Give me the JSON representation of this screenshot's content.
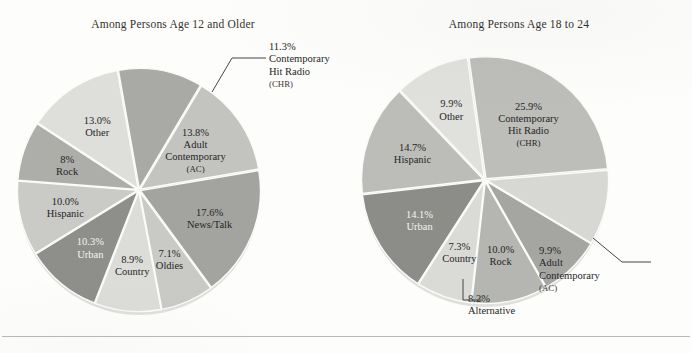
{
  "figure": {
    "background_color": "#fdfdfc",
    "rule_color": "#b9b9b6"
  },
  "chart_data": [
    {
      "type": "pie",
      "id": "age-12-and-older",
      "title": "Among Persons Age 12 and Older",
      "start_angle_deg": 350,
      "direction": "clockwise",
      "center": {
        "x": 139,
        "y": 190
      },
      "radius": 120,
      "categories": [
        "Contemporary Hit Radio (CHR)",
        "Adult Contemporary (AC)",
        "News/Talk",
        "Oldies",
        "Country",
        "Urban",
        "Hispanic",
        "Rock",
        "Other"
      ],
      "values": [
        11.3,
        13.8,
        17.6,
        7.1,
        8.9,
        10.3,
        10.0,
        8.0,
        13.0
      ],
      "slices": [
        {
          "label_pct": "11.3%",
          "name_lines": [
            "Contemporary",
            "Hit Radio"
          ],
          "sub": "(CHR)",
          "value": 11.3,
          "color": "#a9a9a6",
          "label_mode": "callout",
          "text_color": "dark"
        },
        {
          "label_pct": "13.8%",
          "name_lines": [
            "Adult",
            "Contemporary"
          ],
          "sub": "(AC)",
          "value": 13.8,
          "color": "#c3c3bf",
          "label_mode": "inside",
          "text_color": "dark"
        },
        {
          "label_pct": "17.6%",
          "name_lines": [
            "News/Talk"
          ],
          "sub": "",
          "value": 17.6,
          "color": "#a3a3a0",
          "label_mode": "inside",
          "text_color": "dark"
        },
        {
          "label_pct": "7.1%",
          "name_lines": [
            "Oldies"
          ],
          "sub": "",
          "value": 7.1,
          "color": "#c9c9c5",
          "label_mode": "inside",
          "text_color": "dark"
        },
        {
          "label_pct": "8.9%",
          "name_lines": [
            "Country"
          ],
          "sub": "",
          "value": 8.9,
          "color": "#dcdcd8",
          "label_mode": "inside",
          "text_color": "dark"
        },
        {
          "label_pct": "10.3%",
          "name_lines": [
            "Urban"
          ],
          "sub": "",
          "value": 10.3,
          "color": "#8e8e8b",
          "label_mode": "inside",
          "text_color": "light"
        },
        {
          "label_pct": "10.0%",
          "name_lines": [
            "Hispanic"
          ],
          "sub": "",
          "value": 10.0,
          "color": "#cacac6",
          "label_mode": "inside",
          "text_color": "dark"
        },
        {
          "label_pct": "8%",
          "name_lines": [
            "Rock"
          ],
          "sub": "",
          "value": 8.0,
          "color": "#adadaa",
          "label_mode": "inside",
          "text_color": "dark"
        },
        {
          "label_pct": "13.0%",
          "name_lines": [
            "Other"
          ],
          "sub": "",
          "value": 13.0,
          "color": "#dedeDA",
          "label_mode": "inside",
          "text_color": "dark"
        }
      ],
      "callout": {
        "pct": "11.3%",
        "line1": "Contemporary",
        "line2": "Hit Radio",
        "sub": "(CHR)"
      }
    },
    {
      "type": "pie",
      "id": "age-18-to-24",
      "title": "Among Persons Age 18 to 24",
      "start_angle_deg": 352,
      "direction": "clockwise",
      "center": {
        "x": 139,
        "y": 180
      },
      "radius": 122,
      "categories": [
        "Contemporary Hit Radio (CHR)",
        "Adult Contemporary (AC)",
        "Alternative",
        "Rock",
        "Country",
        "Urban",
        "Hispanic",
        "Other"
      ],
      "values": [
        25.9,
        9.9,
        8.2,
        10.0,
        7.3,
        14.1,
        14.7,
        9.9
      ],
      "slices": [
        {
          "label_pct": "25.9%",
          "name_lines": [
            "Contemporary",
            "Hit Radio"
          ],
          "sub": "(CHR)",
          "value": 25.9,
          "color": "#bdbdb9",
          "label_mode": "inside",
          "text_color": "dark"
        },
        {
          "label_pct": "9.9%",
          "name_lines": [
            "Adult",
            "Contemporary"
          ],
          "sub": "(AC)",
          "value": 9.9,
          "color": "#d7d7d3",
          "label_mode": "callout",
          "text_color": "dark"
        },
        {
          "label_pct": "8.2%",
          "name_lines": [
            "Alternative"
          ],
          "sub": "",
          "value": 8.2,
          "color": "#a5a5a2",
          "label_mode": "callout",
          "text_color": "dark"
        },
        {
          "label_pct": "10.0%",
          "name_lines": [
            "Rock"
          ],
          "sub": "",
          "value": 10.0,
          "color": "#b5b5b1",
          "label_mode": "inside",
          "text_color": "dark"
        },
        {
          "label_pct": "7.3%",
          "name_lines": [
            "Country"
          ],
          "sub": "",
          "value": 7.3,
          "color": "#dadad6",
          "label_mode": "inside",
          "text_color": "dark"
        },
        {
          "label_pct": "14.1%",
          "name_lines": [
            "Urban"
          ],
          "sub": "",
          "value": 14.1,
          "color": "#8c8c89",
          "label_mode": "inside",
          "text_color": "light"
        },
        {
          "label_pct": "14.7%",
          "name_lines": [
            "Hispanic"
          ],
          "sub": "",
          "value": 14.7,
          "color": "#bcbcb8",
          "label_mode": "inside",
          "text_color": "dark"
        },
        {
          "label_pct": "9.9%",
          "name_lines": [
            "Other"
          ],
          "sub": "",
          "value": 9.9,
          "color": "#e0e0dc",
          "label_mode": "inside",
          "text_color": "dark"
        }
      ],
      "callouts": [
        {
          "pct": "9.9%",
          "line1": "Adult",
          "line2": "Contemporary",
          "sub": "(AC)"
        },
        {
          "pct": "8.2%",
          "line1": "Alternative",
          "line2": "",
          "sub": ""
        }
      ]
    }
  ]
}
